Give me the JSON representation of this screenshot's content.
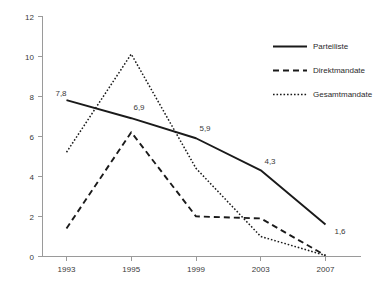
{
  "chart_data": {
    "type": "line",
    "title": "",
    "subtitle": "",
    "xlabel": "",
    "ylabel": "",
    "categories": [
      "1993",
      "1995",
      "1999",
      "2003",
      "2007"
    ],
    "x": [
      1993,
      1995,
      1999,
      2003,
      2007
    ],
    "xlim": [
      1993,
      2007
    ],
    "ylim": [
      0,
      12
    ],
    "yticks": [
      0,
      2,
      4,
      6,
      8,
      10,
      12
    ],
    "ytick_labels": [
      "0",
      "2",
      "4",
      "6",
      "8",
      "10",
      "12"
    ],
    "grid": false,
    "legend_position": "top-right",
    "series": [
      {
        "name": "Parteiliste",
        "style": "solid",
        "color": "#1a1a1a",
        "values": [
          7.8,
          6.9,
          5.9,
          4.3,
          1.6
        ],
        "labels": [
          "7,8",
          "6,9",
          "5,9",
          "4,3",
          "1,6"
        ]
      },
      {
        "name": "Direktmandate",
        "style": "dashed",
        "color": "#1a1a1a",
        "values": [
          1.4,
          6.2,
          2.0,
          1.9,
          0.05
        ],
        "labels": [
          "",
          "",
          "",
          "",
          ""
        ]
      },
      {
        "name": "Gesamtmandate",
        "style": "dotted",
        "color": "#1a1a1a",
        "values": [
          5.2,
          10.1,
          4.4,
          1.0,
          0.05
        ],
        "labels": [
          "",
          "",
          "",
          "",
          ""
        ]
      }
    ],
    "annotations": [
      {
        "series": "Parteiliste",
        "category": "1993",
        "text": "7,8"
      },
      {
        "series": "Parteiliste",
        "category": "1995",
        "text": "6,9"
      },
      {
        "series": "Parteiliste",
        "category": "1999",
        "text": "5,9"
      },
      {
        "series": "Parteiliste",
        "category": "2003",
        "text": "4,3"
      },
      {
        "series": "Parteiliste",
        "category": "2007",
        "text": "1,6"
      }
    ]
  },
  "legend": {
    "items": [
      {
        "label": "Parteiliste"
      },
      {
        "label": "Direktmandate"
      },
      {
        "label": "Gesamtmandate"
      }
    ]
  },
  "axis": {
    "y_labels": [
      "12",
      "10",
      "8",
      "6",
      "4",
      "2",
      "0"
    ],
    "x_labels": [
      "1993",
      "1995",
      "1999",
      "2003",
      "2007"
    ]
  },
  "colors": {
    "axis": "#9a9a9a",
    "ink": "#1a1a1a",
    "text": "#3a3a3a",
    "background": "#ffffff"
  }
}
